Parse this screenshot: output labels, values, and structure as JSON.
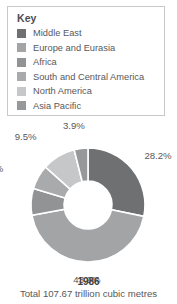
{
  "legend": {
    "title": "Key",
    "items": [
      {
        "label": "Middle East",
        "color": "#6f7072"
      },
      {
        "label": "Europe and Eurasia",
        "color": "#a3a4a6"
      },
      {
        "label": "Africa",
        "color": "#929395"
      },
      {
        "label": "South and Central America",
        "color": "#a9aaac"
      },
      {
        "label": "North America",
        "color": "#c6c7c9"
      },
      {
        "label": "Asia Pacific",
        "color": "#97989a"
      }
    ]
  },
  "caption": {
    "year": "1986",
    "total": "Total 107.67 trillion cubic metres"
  },
  "chart_data": {
    "type": "pie",
    "title": "1986",
    "subtitle": "Total 107.67 trillion cubic metres",
    "donut": true,
    "inner_radius_ratio": 0.42,
    "start_angle": 0,
    "direction": "clockwise",
    "unit": "percent",
    "categories": [
      "Middle East",
      "Europe and Eurasia",
      "Africa",
      "South and Central America",
      "North America",
      "Asia Pacific"
    ],
    "values": [
      28.2,
      43.9,
      7.6,
      6.9,
      9.5,
      3.9
    ],
    "labels": [
      "28.2%",
      "43.9%",
      "7.6%",
      "6.9%",
      "9.5%",
      "3.9%"
    ],
    "colors": [
      "#6f7072",
      "#a3a4a6",
      "#929395",
      "#a9aaac",
      "#c6c7c9",
      "#97989a"
    ],
    "legend_position": "top",
    "grid": false
  }
}
